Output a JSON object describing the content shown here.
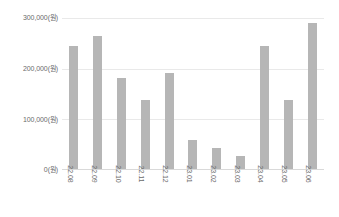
{
  "chart_data": {
    "type": "bar",
    "title": "",
    "subtitle": "",
    "xlabel": "",
    "ylabel": "",
    "unit": "원",
    "grid": true,
    "legend": null,
    "ylim": [
      0,
      300000
    ],
    "ytick_values": [
      0,
      100000,
      200000,
      300000
    ],
    "ytick_labels": [
      "0(원)",
      "100,000(원)",
      "200,000(원)",
      "300,000(원)"
    ],
    "categories": [
      "22.08",
      "22.09",
      "22.10",
      "22.11",
      "22.12",
      "23.01",
      "23.02",
      "23.03",
      "23.04",
      "23.05",
      "23.06"
    ],
    "values": [
      245000,
      265000,
      180000,
      137000,
      190000,
      57000,
      42000,
      25000,
      245000,
      137000,
      290000
    ],
    "bar_color": "#b6b6b6",
    "gridline_color": "#e9e9e9",
    "tick_label_color": "#6b6b6b",
    "background_color": "#ffffff"
  }
}
